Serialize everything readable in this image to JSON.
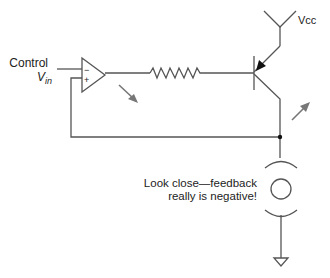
{
  "diagram": {
    "type": "circuit-schematic",
    "labels": {
      "control": "Control",
      "vin_main": "V",
      "vin_sub": "in",
      "vcc": "Vcc",
      "opamp_minus": "−",
      "opamp_plus": "+",
      "note_line1": "Look close—feedback",
      "note_line2": "really is negative!"
    },
    "components": [
      {
        "id": "opamp",
        "kind": "operational-amplifier"
      },
      {
        "id": "resistor",
        "kind": "resistor"
      },
      {
        "id": "transistor",
        "kind": "pnp-bjt"
      },
      {
        "id": "vcc",
        "kind": "supply-rail"
      },
      {
        "id": "lamp",
        "kind": "lamp"
      },
      {
        "id": "ground",
        "kind": "ground"
      }
    ],
    "colors": {
      "wire": "#555555",
      "arrow": "#777777",
      "text": "#222222"
    }
  }
}
